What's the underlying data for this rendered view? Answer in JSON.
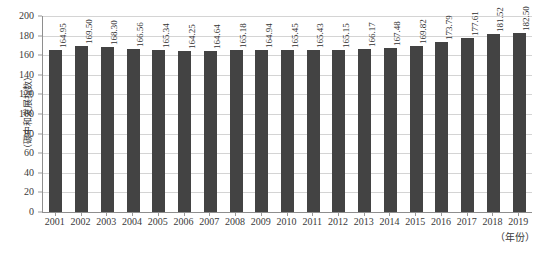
{
  "chart_data": {
    "type": "bar",
    "title": "",
    "subtitle": "",
    "xlabel": "（年份）",
    "ylabel": "（碳中和发展指数）",
    "categories": [
      "2001",
      "2002",
      "2003",
      "2004",
      "2005",
      "2006",
      "2007",
      "2008",
      "2009",
      "2010",
      "2011",
      "2012",
      "2013",
      "2014",
      "2015",
      "2016",
      "2017",
      "2018",
      "2019"
    ],
    "values": [
      164.95,
      169.5,
      168.3,
      166.56,
      165.34,
      164.25,
      164.64,
      165.18,
      164.94,
      165.45,
      165.43,
      165.15,
      166.17,
      167.48,
      169.82,
      173.79,
      177.61,
      181.52,
      182.5
    ],
    "value_labels": [
      "164.95",
      "169.50",
      "168.30",
      "166.56",
      "165.34",
      "164.25",
      "164.64",
      "165.18",
      "164.94",
      "165.45",
      "165.43",
      "165.15",
      "166.17",
      "167.48",
      "169.82",
      "173.79",
      "177.61",
      "181.52",
      "182.50"
    ],
    "ylim": [
      0,
      200
    ],
    "ytick_step": 20,
    "yticks": [
      0,
      20,
      40,
      60,
      80,
      100,
      120,
      140,
      160,
      180,
      200
    ],
    "ytick_labels": [
      "0",
      "20",
      "40",
      "60",
      "80",
      "100",
      "120",
      "140",
      "160",
      "180",
      "200"
    ],
    "grid": true,
    "grid_axis": "y",
    "legend": false,
    "legend_position": "none",
    "series_color": "#434343",
    "gridline_color": "#d4d4d4",
    "axis_color": "#8e8e8e",
    "background_color": "#ffffff",
    "value_label_rotation": -90
  }
}
